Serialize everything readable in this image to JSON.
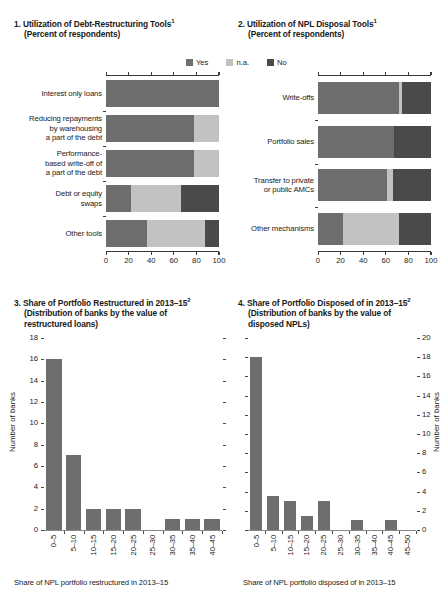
{
  "colors": {
    "yes": "#6e6e6e",
    "na": "#c2c2c2",
    "no": "#4a4a4a",
    "axis": "#3a3a3a",
    "bar": "#6e6e6e"
  },
  "legend": {
    "items": [
      {
        "label": "Yes",
        "color": "#6e6e6e"
      },
      {
        "label": "n.a.",
        "color": "#c2c2c2"
      },
      {
        "label": "No",
        "color": "#4a4a4a"
      }
    ]
  },
  "panel1": {
    "number": "1.",
    "title": "Utilization of Debt-Restructuring Tools",
    "title_sup": "1",
    "subtitle": "(Percent of respondents)"
  },
  "panel2": {
    "number": "2.",
    "title": "Utilization of NPL Disposal Tools",
    "title_sup": "1",
    "subtitle": "(Percent of respondents)"
  },
  "panel3": {
    "number": "3.",
    "title": "Share of Portfolio Restructured in 2013–15",
    "title_sup": "2",
    "subtitle_line1": "(Distribution of banks by the value of",
    "subtitle_line2": "restructured loans)"
  },
  "panel4": {
    "number": "4.",
    "title": "Share of Portfolio Disposed of in 2013–15",
    "title_sup": "2",
    "subtitle_line1": "(Distribution of banks by the value of",
    "subtitle_line2": "disposed NPLs)"
  },
  "chart_data": [
    {
      "id": "panel1",
      "type": "bar",
      "orientation": "horizontal",
      "stacked": true,
      "title": "1. Utilization of Debt-Restructuring Tools",
      "subtitle": "(Percent of respondents)",
      "xlabel": "",
      "ylabel": "",
      "xlim": [
        0,
        100
      ],
      "xticks": [
        0,
        20,
        40,
        60,
        80,
        100
      ],
      "xticklabels": [
        "0",
        "20",
        "40",
        "60",
        "80",
        "100"
      ],
      "grid": false,
      "legend_position": "top-right",
      "categories": [
        "Interest only loans",
        "Reducing repayments by warehousing a part of the debt",
        "Performance-based write-off of a part of the debt",
        "Debt or equity swaps",
        "Other tools"
      ],
      "category_lines": [
        [
          "Interest only loans"
        ],
        [
          "Reducing repayments",
          "by warehousing",
          "a part of the debt"
        ],
        [
          "Performance-",
          "based write-off of",
          "a part of the debt"
        ],
        [
          "Debt or equity",
          "swaps"
        ],
        [
          "Other tools"
        ]
      ],
      "series": [
        {
          "name": "Yes",
          "color": "#6e6e6e",
          "values": [
            100,
            78,
            78,
            22,
            36
          ]
        },
        {
          "name": "n.a.",
          "color": "#c2c2c2",
          "values": [
            0,
            22,
            22,
            44,
            52
          ]
        },
        {
          "name": "No",
          "color": "#4a4a4a",
          "values": [
            0,
            0,
            0,
            34,
            12
          ]
        }
      ]
    },
    {
      "id": "panel2",
      "type": "bar",
      "orientation": "horizontal",
      "stacked": true,
      "title": "2. Utilization of NPL Disposal Tools",
      "subtitle": "(Percent of respondents)",
      "xlabel": "",
      "ylabel": "",
      "xlim": [
        0,
        100
      ],
      "xticks": [
        0,
        20,
        40,
        60,
        80,
        100
      ],
      "xticklabels": [
        "0",
        "20",
        "40",
        "60",
        "80",
        "100"
      ],
      "grid": false,
      "legend_position": "top-right",
      "categories": [
        "Write-offs",
        "Portfolio sales",
        "Transfer to private or public AMCs",
        "Other mechanisms"
      ],
      "category_lines": [
        [
          "Write-offs"
        ],
        [
          "Portfolio sales"
        ],
        [
          "Transfer to private",
          "or public AMCs"
        ],
        [
          "Other mechanisms"
        ]
      ],
      "series": [
        {
          "name": "Yes",
          "color": "#6e6e6e",
          "values": [
            72,
            67,
            61,
            22
          ]
        },
        {
          "name": "n.a.",
          "color": "#c2c2c2",
          "values": [
            2,
            0,
            5,
            50
          ]
        },
        {
          "name": "No",
          "color": "#4a4a4a",
          "values": [
            26,
            33,
            34,
            28
          ]
        }
      ]
    },
    {
      "id": "panel3",
      "type": "bar",
      "orientation": "vertical",
      "title": "3. Share of Portfolio Restructured in 2013–15",
      "subtitle": "(Distribution of banks by the value of restructured loans)",
      "xlabel": "Share of NPL portfolio restructured in 2013–15",
      "ylabel": "Number of banks",
      "ylim": [
        0,
        18
      ],
      "yticks": [
        0,
        2,
        4,
        6,
        8,
        10,
        12,
        14,
        16,
        18
      ],
      "yticklabels": [
        "0",
        "2",
        "4",
        "6",
        "8",
        "10",
        "12",
        "14",
        "16",
        "18"
      ],
      "grid": false,
      "bar_color": "#6e6e6e",
      "categories": [
        "0–5",
        "5–10",
        "10–15",
        "15–20",
        "20–25",
        "25–30",
        "30–35",
        "35–40",
        "40–45"
      ],
      "values": [
        16,
        7,
        2,
        2,
        2,
        0,
        1,
        1,
        1
      ]
    },
    {
      "id": "panel4",
      "type": "bar",
      "orientation": "vertical",
      "title": "4. Share of Portfolio Disposed of in 2013–15",
      "subtitle": "(Distribution of banks by the value of disposed NPLs)",
      "xlabel": "Share of NPL portfolio disposed of in 2013–15",
      "ylabel": "Number of banks",
      "ylim": [
        0,
        20
      ],
      "yticks": [
        0,
        2,
        4,
        6,
        8,
        10,
        12,
        14,
        16,
        18,
        20
      ],
      "yticklabels": [
        "0",
        "2",
        "4",
        "6",
        "8",
        "10",
        "12",
        "14",
        "16",
        "18",
        "20"
      ],
      "y_axis_side": "right",
      "grid": false,
      "bar_color": "#6e6e6e",
      "categories": [
        "0–5",
        "5–10",
        "10–15",
        "15–20",
        "20–25",
        "25–30",
        "30–35",
        "35–40",
        "40–45",
        "45–50"
      ],
      "values": [
        18,
        3.5,
        3,
        1.5,
        3,
        0,
        1,
        0,
        1
      ]
    }
  ]
}
